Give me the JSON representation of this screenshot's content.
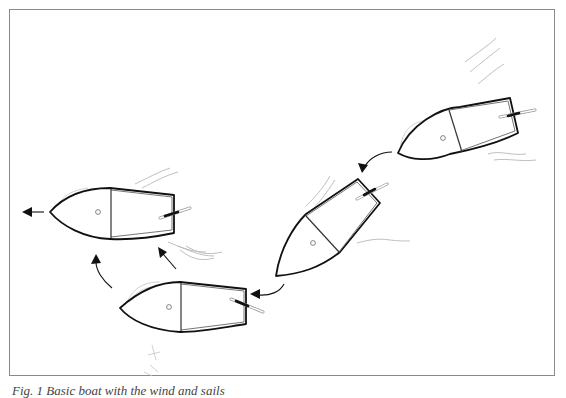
{
  "figure": {
    "caption": "Fig. 1  Basic boat with the wind and sails",
    "caption_note": "caption partially cropped at bottom edge; text reading is approximate",
    "frame_color": "#8a8a8a",
    "line_color": "#111111",
    "sketch_color": "#b8b8b8"
  },
  "boats": [
    {
      "id": "boat-1",
      "position": "top-right",
      "heading": "left-down"
    },
    {
      "id": "boat-2",
      "position": "center",
      "heading": "down-left"
    },
    {
      "id": "boat-3",
      "position": "bottom",
      "heading": "left"
    },
    {
      "id": "boat-4",
      "position": "left",
      "heading": "left"
    }
  ],
  "arrows": [
    {
      "id": "arrow-1-to-2",
      "from": "boat-1",
      "to": "boat-2",
      "style": "curved"
    },
    {
      "id": "arrow-2-to-3",
      "from": "boat-2",
      "to": "boat-3",
      "style": "curved"
    },
    {
      "id": "arrow-3-to-4-curve",
      "from": "boat-3",
      "to": "boat-4",
      "style": "curved"
    },
    {
      "id": "arrow-3-to-4-straight",
      "from": "boat-3",
      "to": "boat-4",
      "style": "straight"
    },
    {
      "id": "arrow-heading",
      "from": "boat-4",
      "to": "off-left",
      "style": "straight"
    }
  ]
}
